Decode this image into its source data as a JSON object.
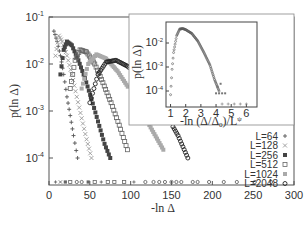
{
  "chart_data": {
    "type": "scatter",
    "title": "",
    "xlabel": "-ln Δ",
    "ylabel": "p(ln Δ)",
    "xlim": [
      0,
      300
    ],
    "ylim_log10": [
      -4.6,
      -1
    ],
    "x_ticks": [
      "0",
      "50",
      "100",
      "150",
      "200",
      "250",
      "300"
    ],
    "y_ticks": [
      "10-1",
      "10-2",
      "10-3",
      "10-4"
    ],
    "grid": false,
    "legend_position": "lower right (inside)",
    "series": [
      {
        "name": "L=64",
        "marker": "+",
        "color": "#555555",
        "points": [
          [
            6,
            0.05
          ],
          [
            10,
            0.03
          ],
          [
            14,
            0.015
          ],
          [
            18,
            0.006
          ],
          [
            22,
            0.002
          ],
          [
            26,
            0.0008
          ],
          [
            30,
            0.0003
          ],
          [
            35,
            0.0001
          ]
        ]
      },
      {
        "name": "L=128",
        "marker": "×",
        "color": "#999999",
        "points": [
          [
            8,
            0.015
          ],
          [
            12,
            0.04
          ],
          [
            16,
            0.03
          ],
          [
            22,
            0.015
          ],
          [
            28,
            0.006
          ],
          [
            34,
            0.002
          ],
          [
            40,
            0.0007
          ],
          [
            46,
            0.00025
          ],
          [
            52,
            0.0001
          ]
        ]
      },
      {
        "name": "L=256",
        "marker": "■",
        "color": "#444444",
        "points": [
          [
            14,
            0.006
          ],
          [
            18,
            0.02
          ],
          [
            22,
            0.03
          ],
          [
            28,
            0.025
          ],
          [
            36,
            0.012
          ],
          [
            44,
            0.005
          ],
          [
            52,
            0.0018
          ],
          [
            60,
            0.0006
          ],
          [
            68,
            0.0002
          ],
          [
            75,
            0.0001
          ]
        ]
      },
      {
        "name": "L=512",
        "marker": "□",
        "color": "#666666",
        "points": [
          [
            26,
            0.003
          ],
          [
            32,
            0.012
          ],
          [
            38,
            0.02
          ],
          [
            46,
            0.018
          ],
          [
            56,
            0.01
          ],
          [
            66,
            0.004
          ],
          [
            76,
            0.0015
          ],
          [
            86,
            0.0005
          ],
          [
            96,
            0.00015
          ]
        ]
      },
      {
        "name": "L=1024",
        "marker": "■",
        "color": "#aaaaaa",
        "points": [
          [
            40,
            0.003
          ],
          [
            48,
            0.01
          ],
          [
            58,
            0.016
          ],
          [
            70,
            0.013
          ],
          [
            84,
            0.007
          ],
          [
            98,
            0.003
          ],
          [
            112,
            0.0011
          ],
          [
            126,
            0.0004
          ],
          [
            140,
            0.00015
          ]
        ]
      },
      {
        "name": "L=2048",
        "marker": "○",
        "color": "#222222",
        "points": [
          [
            50,
            0.0015
          ],
          [
            60,
            0.006
          ],
          [
            70,
            0.011
          ],
          [
            82,
            0.012
          ],
          [
            96,
            0.009
          ],
          [
            112,
            0.005
          ],
          [
            128,
            0.0022
          ],
          [
            144,
            0.0008
          ],
          [
            158,
            0.0003
          ],
          [
            170,
            0.0001
          ]
        ]
      }
    ],
    "inset": {
      "type": "scatter",
      "xlabel": "-ln (Δ/Δ0)/L^ψ",
      "ylabel": "p(ln Δ)",
      "x_ticks": [
        "1",
        "2",
        "3",
        "4",
        "5",
        "6"
      ],
      "y_ticks": [
        "10-2",
        "10-3",
        "10-4"
      ],
      "description": "All system sizes collapse onto a single curve",
      "collapsed_curve": [
        [
          1.0,
          7e-05
        ],
        [
          1.1,
          0.0008
        ],
        [
          1.2,
          0.004
        ],
        [
          1.4,
          0.02
        ],
        [
          1.6,
          0.038
        ],
        [
          1.8,
          0.04
        ],
        [
          2.0,
          0.036
        ],
        [
          2.4,
          0.025
        ],
        [
          2.8,
          0.012
        ],
        [
          3.2,
          0.004
        ],
        [
          3.6,
          0.0012
        ],
        [
          3.9,
          0.0003
        ],
        [
          4.2,
          0.0001
        ]
      ]
    }
  },
  "labels": {
    "xlabel": "-ln Δ",
    "ylabel": "p(ln Δ)",
    "inset_xlabel_main": "-ln (Δ/Δ",
    "inset_xlabel_sub": "0",
    "inset_xlabel_tail": ")/L",
    "inset_xlabel_sup": "ψ",
    "inset_ylabel": "p(ln Δ)"
  },
  "legend": [
    {
      "label": "L=64",
      "marker": "+"
    },
    {
      "label": "L=128",
      "marker": "×"
    },
    {
      "label": "L=256",
      "marker": "■"
    },
    {
      "label": "L=512",
      "marker": "□"
    },
    {
      "label": "L=1024",
      "marker": "■"
    },
    {
      "label": "L=2048",
      "marker": "○"
    }
  ],
  "ticks": {
    "x": [
      "0",
      "50",
      "100",
      "150",
      "200",
      "250",
      "300"
    ],
    "y": [
      {
        "base": "10",
        "exp": "-1"
      },
      {
        "base": "10",
        "exp": "-2"
      },
      {
        "base": "10",
        "exp": "-3"
      },
      {
        "base": "10",
        "exp": "-4"
      }
    ],
    "inset_x": [
      "1",
      "2",
      "3",
      "4",
      "5",
      "6"
    ],
    "inset_y": [
      {
        "base": "10",
        "exp": "-2"
      },
      {
        "base": "10",
        "exp": "-3"
      },
      {
        "base": "10",
        "exp": "-4"
      }
    ]
  }
}
